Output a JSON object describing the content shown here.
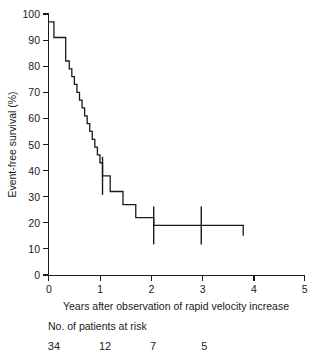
{
  "chart_data": {
    "type": "line",
    "subtype": "kaplan-meier-step",
    "title": "",
    "xlabel": "Years after observation of rapid velocity increase",
    "ylabel": "Event-free survival (%)",
    "xlim": [
      0,
      5
    ],
    "ylim": [
      0,
      100
    ],
    "xticks": [
      0,
      1,
      2,
      3,
      4,
      5
    ],
    "yticks": [
      0,
      10,
      20,
      30,
      40,
      50,
      60,
      70,
      80,
      90,
      100
    ],
    "xticklabels": [
      "0",
      "1",
      "2",
      "3",
      "4",
      "5"
    ],
    "yticklabels": [
      "0",
      "10",
      "20",
      "30",
      "40",
      "50",
      "60",
      "70",
      "80",
      "90",
      "100"
    ],
    "grid": false,
    "legend": false,
    "series": [
      {
        "name": "Event-free survival",
        "step": "post",
        "x": [
          0.0,
          0.05,
          0.1,
          0.28,
          0.33,
          0.4,
          0.45,
          0.5,
          0.55,
          0.6,
          0.65,
          0.7,
          0.75,
          0.8,
          0.85,
          0.9,
          0.95,
          1.0,
          1.05,
          1.12,
          1.2,
          1.28,
          1.36,
          1.45,
          1.7,
          2.05,
          2.98,
          3.8
        ],
        "y": [
          97,
          97,
          91,
          91,
          82,
          79,
          76,
          73,
          70,
          67,
          64,
          61,
          58,
          55,
          52,
          49,
          46,
          43,
          38,
          38,
          32,
          32,
          32,
          27,
          22,
          19,
          19,
          15
        ]
      }
    ],
    "censored_points": [
      {
        "x": 1.05,
        "y": 38
      },
      {
        "x": 2.05,
        "y": 19
      },
      {
        "x": 2.98,
        "y": 19
      }
    ],
    "risk_table": {
      "label": "No. of patients at risk",
      "times": [
        0,
        1,
        2,
        3
      ],
      "counts": [
        "34",
        "12",
        "7",
        "5"
      ]
    }
  },
  "axes": {
    "y_title": "Event-free survival (%)",
    "x_title": "Years after observation of rapid velocity increase"
  }
}
